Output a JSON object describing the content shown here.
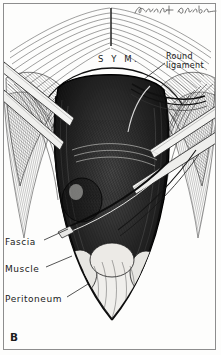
{
  "figure": {
    "panel_label": "B",
    "medium": "pen-and-ink engraving",
    "background_color": "#fdfdfc",
    "ink_color": "#1b1b1b",
    "border_color": "#8d8d8d"
  },
  "signature": {
    "name": "artist-signature",
    "text": "",
    "description": "cursive ink signature, upper right"
  },
  "labels": {
    "symphysis": "S Y M.",
    "round_ligament": "Round ligament",
    "fascia": "Fascia",
    "muscle": "Muscle",
    "peritoneum": "Peritoneum"
  },
  "leaders": [
    {
      "name": "leader-round-ligament",
      "from": [
        166,
        62
      ],
      "to": [
        140,
        78
      ]
    },
    {
      "name": "leader-fascia",
      "from": [
        44,
        243
      ],
      "to": [
        66,
        232
      ]
    },
    {
      "name": "leader-muscle",
      "from": [
        46,
        270
      ],
      "to": [
        70,
        258
      ]
    },
    {
      "name": "leader-peritoneum",
      "from": [
        66,
        300
      ],
      "to": [
        86,
        286
      ]
    }
  ]
}
